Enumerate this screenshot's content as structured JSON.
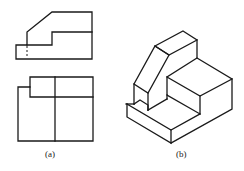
{
  "figure": {
    "panel_a": {
      "label": "(a)",
      "views": [
        "front-view",
        "top-view"
      ]
    },
    "panel_b": {
      "label": "(b)",
      "views": [
        "isometric-view"
      ]
    }
  },
  "colors": {
    "line": "#1a1a1a",
    "background": "#ffffff"
  }
}
